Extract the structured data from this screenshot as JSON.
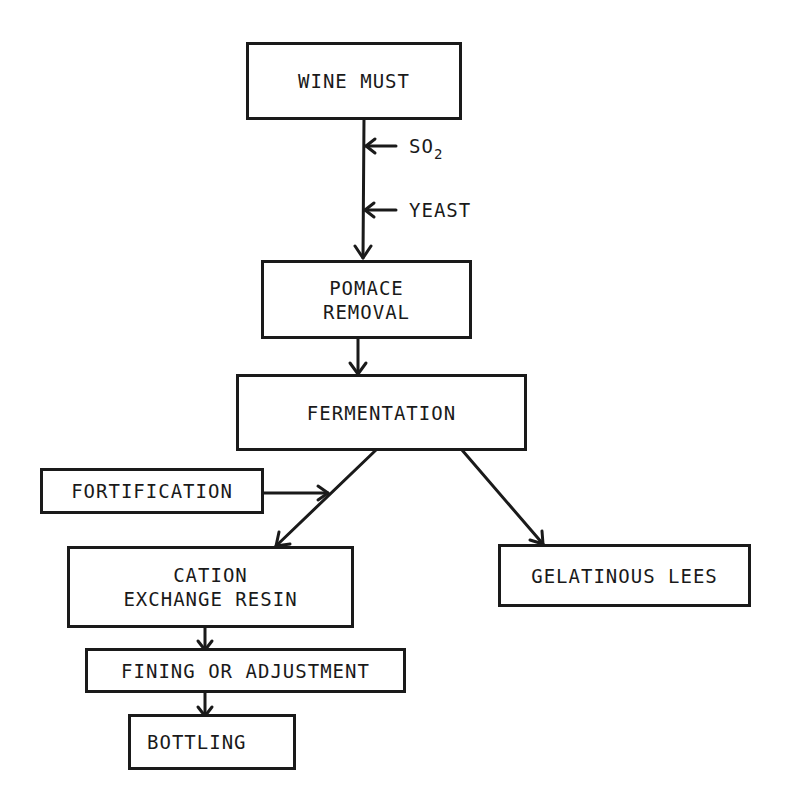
{
  "diagram": {
    "type": "flowchart",
    "nodes": {
      "wine_must": "WINE MUST",
      "pomace_removal": [
        "POMACE",
        "REMOVAL"
      ],
      "fermentation": "FERMENTATION",
      "fortification": "FORTIFICATION",
      "cation_exchange_resin": [
        "CATION",
        "EXCHANGE RESIN"
      ],
      "gelatinous_lees": "GELATINOUS LEES",
      "fining_or_adjustment": "FINING OR ADJUSTMENT",
      "bottling": "BOTTLING"
    },
    "inputs": {
      "so2_base": "SO",
      "so2_sub": "2",
      "yeast": "YEAST"
    },
    "edges": [
      {
        "from": "WINE MUST",
        "to": "POMACE REMOVAL",
        "inputs": [
          "SO2",
          "YEAST"
        ]
      },
      {
        "from": "POMACE REMOVAL",
        "to": "FERMENTATION"
      },
      {
        "from": "FERMENTATION",
        "to": "CATION EXCHANGE RESIN"
      },
      {
        "from": "FORTIFICATION",
        "to": "FERMENTATION→CATION EXCHANGE RESIN edge"
      },
      {
        "from": "FERMENTATION",
        "to": "GELATINOUS LEES"
      },
      {
        "from": "CATION EXCHANGE RESIN",
        "to": "FINING OR ADJUSTMENT"
      },
      {
        "from": "FINING OR ADJUSTMENT",
        "to": "BOTTLING"
      }
    ],
    "colors": {
      "ink": "#1a1a1a",
      "background": "#ffffff"
    }
  }
}
